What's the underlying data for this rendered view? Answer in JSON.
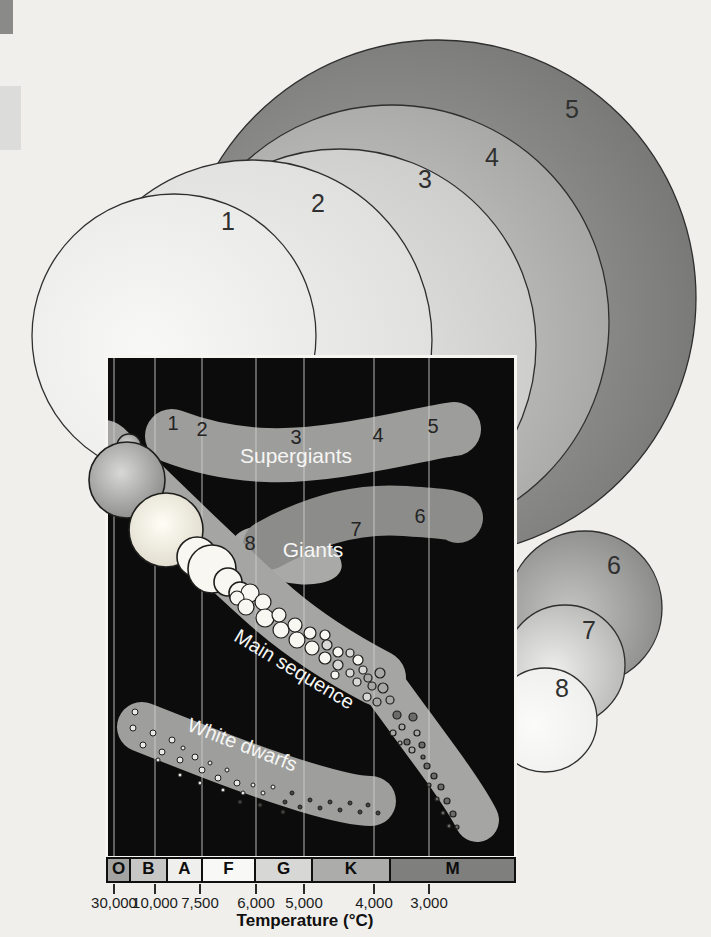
{
  "figure": {
    "background": "#f0efeb",
    "artifacts": [
      {
        "x": 0,
        "y": 0,
        "w": 13,
        "h": 34,
        "color": "#8a8a88"
      },
      {
        "x": 0,
        "y": 86,
        "w": 21,
        "h": 64,
        "color": "#dcdcda"
      }
    ],
    "star_size_circles": [
      {
        "label": "5",
        "cx": 438,
        "cy": 298,
        "r": 258,
        "lx": 572,
        "ly": 118,
        "c0": "#acacaa",
        "c1": "#737371"
      },
      {
        "label": "4",
        "cx": 392,
        "cy": 322,
        "r": 217,
        "lx": 492,
        "ly": 166,
        "c0": "#d5d5d3",
        "c1": "#a2a2a0"
      },
      {
        "label": "3",
        "cx": 340,
        "cy": 345,
        "r": 196,
        "lx": 425,
        "ly": 188,
        "c0": "#e9e9e7",
        "c1": "#cacac8"
      },
      {
        "label": "2",
        "cx": 252,
        "cy": 340,
        "r": 180,
        "lx": 318,
        "ly": 212,
        "c0": "#f2f2f0",
        "c1": "#dededc"
      },
      {
        "label": "1",
        "cx": 174,
        "cy": 336,
        "r": 142,
        "lx": 228,
        "ly": 230,
        "c0": "#f8f8f6",
        "c1": "#e9e9e7"
      },
      {
        "label": "6",
        "cx": 585,
        "cy": 608,
        "r": 77,
        "lx": 614,
        "ly": 574,
        "c0": "#c6c6c4",
        "c1": "#868684"
      },
      {
        "label": "7",
        "cx": 565,
        "cy": 665,
        "r": 60,
        "lx": 589,
        "ly": 639,
        "c0": "#eeeeec",
        "c1": "#b3b3b1"
      },
      {
        "label": "8",
        "cx": 545,
        "cy": 720,
        "r": 52,
        "lx": 562,
        "ly": 697,
        "c0": "#fbfbf9",
        "c1": "#eeeeec"
      }
    ],
    "hr_diagram": {
      "gridlines_x": [
        114,
        155,
        202,
        256,
        304,
        374,
        429
      ],
      "regions": {
        "supergiants": {
          "label": "Supergiants",
          "label_x": 296,
          "label_y": 463,
          "numbers": [
            {
              "n": "1",
              "x": 173,
              "y": 430
            },
            {
              "n": "2",
              "x": 202,
              "y": 436
            },
            {
              "n": "3",
              "x": 296,
              "y": 444
            },
            {
              "n": "4",
              "x": 378,
              "y": 442
            },
            {
              "n": "5",
              "x": 433,
              "y": 433
            }
          ]
        },
        "giants": {
          "label": "Giants",
          "label_x": 313,
          "label_y": 557,
          "numbers": [
            {
              "n": "8",
              "x": 250,
              "y": 550
            },
            {
              "n": "7",
              "x": 356,
              "y": 536
            },
            {
              "n": "6",
              "x": 420,
              "y": 523
            }
          ]
        },
        "main_sequence": {
          "label": "Main sequence",
          "label_x": 291,
          "label_y": 675,
          "angle": 31
        },
        "white_dwarfs": {
          "label": "White dwarfs",
          "label_x": 240,
          "label_y": 751,
          "angle": 21
        }
      },
      "main_sequence_stars": [
        [
          129,
          446,
          12,
          4
        ],
        [
          127,
          480,
          38,
          4
        ],
        [
          166,
          530,
          37,
          5
        ],
        [
          197,
          557,
          20,
          0
        ],
        [
          212,
          569,
          24,
          0
        ],
        [
          228,
          582,
          14,
          0
        ],
        [
          240,
          593,
          11,
          0
        ],
        [
          250,
          593,
          9,
          0
        ],
        [
          237,
          598,
          7,
          0
        ],
        [
          246,
          607,
          8,
          0
        ],
        [
          263,
          602,
          8,
          0
        ],
        [
          265,
          618,
          9,
          0
        ],
        [
          279,
          615,
          7,
          0
        ],
        [
          281,
          630,
          8,
          0
        ],
        [
          295,
          625,
          7,
          0
        ],
        [
          297,
          640,
          8,
          0
        ],
        [
          310,
          633,
          6,
          0
        ],
        [
          312,
          648,
          7,
          0
        ],
        [
          325,
          635,
          5,
          0
        ],
        [
          327,
          645,
          5,
          1
        ],
        [
          338,
          652,
          5,
          0
        ],
        [
          325,
          658,
          6,
          0
        ],
        [
          338,
          665,
          5,
          1
        ],
        [
          350,
          653,
          4,
          1
        ],
        [
          358,
          660,
          5,
          0
        ],
        [
          363,
          670,
          4,
          1
        ],
        [
          350,
          673,
          4,
          1
        ],
        [
          335,
          675,
          4,
          0
        ],
        [
          357,
          682,
          4,
          1
        ],
        [
          368,
          678,
          4,
          2
        ],
        [
          372,
          686,
          4,
          2
        ],
        [
          380,
          673,
          5,
          2
        ],
        [
          383,
          688,
          5,
          2
        ],
        [
          367,
          697,
          4,
          1
        ],
        [
          377,
          702,
          4,
          2
        ],
        [
          390,
          700,
          4,
          2
        ],
        [
          397,
          715,
          4,
          3
        ],
        [
          402,
          727,
          3,
          2
        ],
        [
          413,
          717,
          4,
          3
        ],
        [
          393,
          733,
          3,
          2
        ],
        [
          407,
          742,
          3,
          3
        ],
        [
          417,
          733,
          3,
          2
        ],
        [
          422,
          745,
          3,
          3
        ],
        [
          400,
          743,
          2,
          2
        ],
        [
          412,
          750,
          3,
          2
        ],
        [
          423,
          757,
          2,
          3
        ],
        [
          427,
          766,
          3,
          3
        ],
        [
          434,
          776,
          3,
          3
        ],
        [
          429,
          785,
          2,
          3
        ],
        [
          441,
          787,
          3,
          3
        ],
        [
          437,
          799,
          2,
          3
        ],
        [
          447,
          801,
          3,
          3
        ],
        [
          443,
          813,
          2,
          3
        ],
        [
          453,
          814,
          3,
          3
        ],
        [
          449,
          826,
          2,
          3
        ],
        [
          457,
          827,
          2,
          3
        ]
      ],
      "white_dwarf_stars": [
        [
          135,
          712,
          3,
          0
        ],
        [
          133,
          728,
          3,
          0
        ],
        [
          143,
          745,
          3,
          0
        ],
        [
          153,
          733,
          3,
          0
        ],
        [
          162,
          752,
          3,
          0
        ],
        [
          172,
          740,
          3,
          0
        ],
        [
          180,
          760,
          3,
          0
        ],
        [
          183,
          748,
          2,
          0
        ],
        [
          195,
          757,
          3,
          0
        ],
        [
          202,
          770,
          3,
          0
        ],
        [
          210,
          763,
          2,
          0
        ],
        [
          218,
          778,
          3,
          0
        ],
        [
          227,
          770,
          2,
          0
        ],
        [
          237,
          783,
          3,
          0
        ],
        [
          243,
          793,
          2,
          0
        ],
        [
          253,
          785,
          2,
          0
        ],
        [
          263,
          793,
          2,
          0
        ],
        [
          273,
          787,
          2,
          0
        ],
        [
          285,
          802,
          2,
          3
        ],
        [
          292,
          793,
          2,
          3
        ],
        [
          300,
          807,
          2,
          3
        ],
        [
          310,
          800,
          2,
          3
        ],
        [
          320,
          808,
          2,
          3
        ],
        [
          330,
          802,
          2,
          3
        ],
        [
          340,
          810,
          2,
          3
        ],
        [
          350,
          803,
          2,
          3
        ],
        [
          360,
          812,
          2,
          3
        ],
        [
          368,
          805,
          2,
          3
        ],
        [
          378,
          813,
          2,
          3
        ],
        [
          283,
          812,
          2,
          3
        ],
        [
          260,
          805,
          2,
          3
        ],
        [
          240,
          802,
          2,
          3
        ],
        [
          223,
          790,
          2,
          0
        ],
        [
          200,
          783,
          2,
          0
        ],
        [
          180,
          775,
          2,
          0
        ],
        [
          158,
          760,
          2,
          0
        ]
      ]
    },
    "spectral_bar": {
      "classes": [
        {
          "letter": "O",
          "color": "#a3a3a1",
          "width": 21
        },
        {
          "letter": "B",
          "color": "#c7c7c5",
          "width": 35
        },
        {
          "letter": "A",
          "color": "#efefed",
          "width": 33
        },
        {
          "letter": "F",
          "color": "#f8f8f6",
          "width": 51
        },
        {
          "letter": "G",
          "color": "#d7d7d5",
          "width": 55
        },
        {
          "letter": "K",
          "color": "#acacaa",
          "width": 76
        },
        {
          "letter": "M",
          "color": "#7f7f7d",
          "width": 123
        }
      ]
    },
    "temperature_axis": {
      "label": "Temperature (°C)",
      "ticks": [
        {
          "value": "30,000",
          "x": 114
        },
        {
          "value": "10,000",
          "x": 155
        },
        {
          "value": "7,500",
          "x": 200
        },
        {
          "value": "6,000",
          "x": 256
        },
        {
          "value": "5,000",
          "x": 304
        },
        {
          "value": "4,000",
          "x": 374
        },
        {
          "value": "3,000",
          "x": 429
        }
      ]
    }
  }
}
